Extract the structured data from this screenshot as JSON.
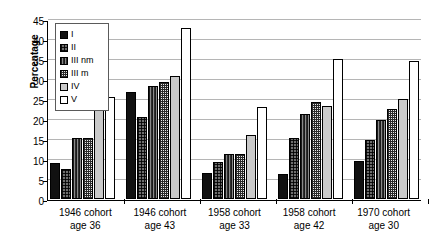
{
  "chart_data": {
    "type": "bar",
    "title": "",
    "xlabel": "",
    "ylabel": "Percentage",
    "ylim": [
      0,
      45
    ],
    "ytick_values": [
      45,
      40,
      35,
      30,
      25,
      20,
      15,
      10,
      5,
      0
    ],
    "ytick_labels": [
      "45",
      "40",
      "35",
      "30",
      "25",
      "20",
      "15",
      "10",
      "5",
      "0"
    ],
    "grid": true,
    "legend_position": "top-left-inside",
    "categories": [
      "1946 cohort age 36",
      "1946 cohort age 43",
      "1958 cohort age 33",
      "1958 cohort age 42",
      "1970 cohort age 30"
    ],
    "category_lines": [
      [
        "1946 cohort",
        "age 36"
      ],
      [
        "1946 cohort",
        "age 43"
      ],
      [
        "1958 cohort",
        "age 33"
      ],
      [
        "1958 cohort",
        "age 42"
      ],
      [
        "1970 cohort",
        "age 30"
      ]
    ],
    "series": [
      {
        "name": "I",
        "pattern": "solid-black",
        "values": [
          9.0,
          26.8,
          6.5,
          6.3,
          9.5
        ]
      },
      {
        "name": "II",
        "pattern": "dark-checker",
        "values": [
          7.5,
          20.4,
          9.3,
          15.2,
          14.8
        ]
      },
      {
        "name": "III nm",
        "pattern": "dark-vertical",
        "values": [
          15.3,
          28.2,
          11.2,
          21.3,
          19.8
        ]
      },
      {
        "name": "III m",
        "pattern": "fine-grid",
        "values": [
          15.3,
          29.3,
          11.2,
          24.3,
          22.4
        ]
      },
      {
        "name": "IV",
        "pattern": "light-gray-solid",
        "values": [
          22.9,
          30.8,
          16.0,
          23.3,
          25.1
        ]
      },
      {
        "name": "V",
        "pattern": "white",
        "values": [
          25.4,
          42.7,
          22.9,
          35.0,
          34.5
        ]
      }
    ]
  },
  "legend": {
    "items": [
      {
        "label": "I"
      },
      {
        "label": "II"
      },
      {
        "label": "III nm"
      },
      {
        "label": "III m"
      },
      {
        "label": "IV"
      },
      {
        "label": "V"
      }
    ]
  }
}
